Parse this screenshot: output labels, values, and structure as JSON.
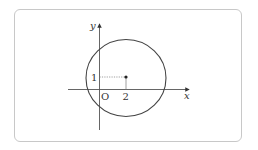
{
  "diagram": {
    "type": "coordinate-plane-circle",
    "axes": {
      "x_label": "x",
      "y_label": "y",
      "origin_label": "O"
    },
    "circle": {
      "center": {
        "x": 2,
        "y": 1
      },
      "center_labels": {
        "x_tick": "2",
        "y_tick": "1"
      }
    },
    "colors": {
      "stroke": "#333333",
      "frame": "#c8c8c8",
      "guide": "#777777"
    }
  }
}
